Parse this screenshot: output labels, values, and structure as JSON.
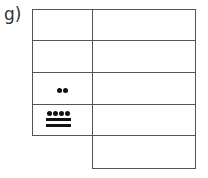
{
  "label": "g)",
  "table": {
    "rows": 5,
    "columns": 2,
    "left_column_rows": 4,
    "right_column_rows": 5,
    "cells": [
      {
        "row": 1,
        "col": 1,
        "content": ""
      },
      {
        "row": 2,
        "col": 1,
        "content": ""
      },
      {
        "row": 3,
        "col": 1,
        "content": "maya-numeral-2",
        "dots": 2,
        "bars": 0
      },
      {
        "row": 4,
        "col": 1,
        "content": "maya-numeral-14",
        "dots": 4,
        "bars": 2
      },
      {
        "row": 1,
        "col": 2,
        "content": ""
      },
      {
        "row": 2,
        "col": 2,
        "content": ""
      },
      {
        "row": 3,
        "col": 2,
        "content": ""
      },
      {
        "row": 4,
        "col": 2,
        "content": ""
      },
      {
        "row": 5,
        "col": 2,
        "content": ""
      }
    ]
  }
}
